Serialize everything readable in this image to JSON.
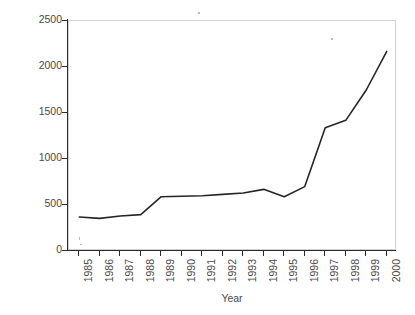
{
  "chart_data": {
    "type": "line",
    "title": "",
    "xlabel": "Year",
    "ylabel": "Number of articles",
    "categories": [
      "1985",
      "1986",
      "1987",
      "1988",
      "1989",
      "1990",
      "1991",
      "1992",
      "1993",
      "1994",
      "1995",
      "1996",
      "1997",
      "1998",
      "1999",
      "2000"
    ],
    "values": [
      370,
      355,
      380,
      395,
      590,
      595,
      600,
      615,
      630,
      670,
      590,
      700,
      1340,
      1420,
      1750,
      2170
    ],
    "series": [
      {
        "name": "Number of articles",
        "values": [
          370,
          355,
          380,
          395,
          590,
          595,
          600,
          615,
          630,
          670,
          590,
          700,
          1340,
          1420,
          1750,
          2170
        ]
      }
    ],
    "ylim": [
      0,
      2500
    ],
    "ytick_labels": [
      "0",
      "500",
      "1000",
      "1500",
      "2000",
      "2500"
    ],
    "ytick_values": [
      0,
      500,
      1000,
      1500,
      2000,
      2500
    ],
    "grid": false,
    "legend": false,
    "legend_position": "none",
    "line_color": "#262626",
    "line_width": 1.6,
    "markers": false,
    "frame_color": "#d2d2d2",
    "axis_color": "#2b2b2b"
  }
}
